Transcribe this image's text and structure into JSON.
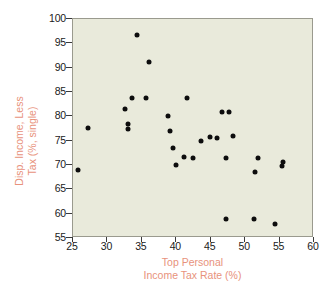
{
  "chart_data": {
    "type": "scatter",
    "title": "",
    "xlabel": "Top Personal Income Tax Rate (%)",
    "xlabel_lines": [
      "Top Personal",
      "Income Tax Rate (%)"
    ],
    "ylabel": "Disp. Income, Less Tax (%, single)",
    "ylabel_lines": [
      "Disp. Income, Less",
      "Tax (%, single)"
    ],
    "xlim": [
      25,
      60
    ],
    "ylim": [
      55,
      100
    ],
    "xticks": [
      25,
      30,
      35,
      40,
      45,
      50,
      55,
      60
    ],
    "yticks": [
      55,
      60,
      65,
      70,
      75,
      80,
      85,
      90,
      95,
      100
    ],
    "grid": false,
    "legend": null,
    "marker": "filled-circle",
    "marker_color": "#0d0d0d",
    "plot_background": "#e9eadb",
    "axis_label_color": "#e8927c",
    "points": [
      {
        "x": 25.9,
        "y": 68.8
      },
      {
        "x": 27.3,
        "y": 77.4
      },
      {
        "x": 32.7,
        "y": 81.2
      },
      {
        "x": 33.7,
        "y": 83.6
      },
      {
        "x": 33.1,
        "y": 78.2
      },
      {
        "x": 33.1,
        "y": 77.2
      },
      {
        "x": 34.4,
        "y": 96.5
      },
      {
        "x": 35.7,
        "y": 83.6
      },
      {
        "x": 36.2,
        "y": 91.0
      },
      {
        "x": 38.9,
        "y": 79.8
      },
      {
        "x": 39.2,
        "y": 76.8
      },
      {
        "x": 39.7,
        "y": 73.2
      },
      {
        "x": 40.1,
        "y": 69.7
      },
      {
        "x": 41.7,
        "y": 83.6
      },
      {
        "x": 41.3,
        "y": 71.5
      },
      {
        "x": 42.6,
        "y": 71.3
      },
      {
        "x": 43.8,
        "y": 74.8
      },
      {
        "x": 45.1,
        "y": 75.5
      },
      {
        "x": 46.1,
        "y": 75.4
      },
      {
        "x": 46.8,
        "y": 80.6
      },
      {
        "x": 47.8,
        "y": 80.6
      },
      {
        "x": 48.4,
        "y": 75.8
      },
      {
        "x": 47.4,
        "y": 71.2
      },
      {
        "x": 47.4,
        "y": 58.7
      },
      {
        "x": 51.5,
        "y": 58.8
      },
      {
        "x": 51.6,
        "y": 68.3
      },
      {
        "x": 52.0,
        "y": 71.3
      },
      {
        "x": 54.5,
        "y": 57.6
      },
      {
        "x": 55.5,
        "y": 69.5
      },
      {
        "x": 55.6,
        "y": 70.4
      }
    ]
  }
}
